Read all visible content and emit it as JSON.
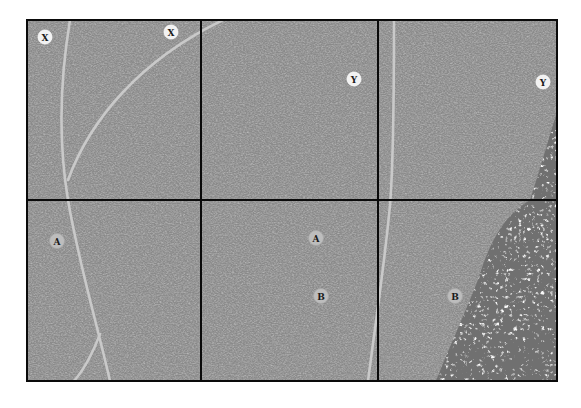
{
  "figure": {
    "type": "six-panel texture diagram",
    "grid": {
      "rows": 2,
      "cols": 3
    },
    "colors": {
      "background": "#ffffff",
      "texture_base": "#8a8a8a",
      "texture_dark": "#5e5e5e",
      "texture_light": "#b4b4b4",
      "frame": "#0a0a0a",
      "trace_line": "#c9c9c9",
      "coarse_region_light": "#eeeeee",
      "marker_top_fill": "#f2f2f2",
      "marker_bottom_fill": "#bdbdbd",
      "marker_text": "#1a1a1a"
    }
  },
  "panels": [
    {
      "id": "top-left",
      "row": 1,
      "col": 1
    },
    {
      "id": "top-middle",
      "row": 1,
      "col": 2
    },
    {
      "id": "top-right",
      "row": 1,
      "col": 3
    },
    {
      "id": "bottom-left",
      "row": 2,
      "col": 1
    },
    {
      "id": "bottom-middle",
      "row": 2,
      "col": 2
    },
    {
      "id": "bottom-right",
      "row": 2,
      "col": 3
    }
  ],
  "markers": [
    {
      "label": "X",
      "panel": "top-left",
      "cx": 45,
      "cy": 37,
      "style": "bright"
    },
    {
      "label": "X",
      "panel": "top-left",
      "cx": 171,
      "cy": 32,
      "style": "bright"
    },
    {
      "label": "Y",
      "panel": "top-middle",
      "cx": 354,
      "cy": 79,
      "style": "bright"
    },
    {
      "label": "Y",
      "panel": "top-right",
      "cx": 543,
      "cy": 82,
      "style": "bright"
    },
    {
      "label": "A",
      "panel": "bottom-left",
      "cx": 57,
      "cy": 241,
      "style": "dim"
    },
    {
      "label": "A",
      "panel": "bottom-middle",
      "cx": 316,
      "cy": 238,
      "style": "dim"
    },
    {
      "label": "B",
      "panel": "bottom-middle",
      "cx": 321,
      "cy": 296,
      "style": "dim"
    },
    {
      "label": "B",
      "panel": "bottom-right",
      "cx": 455,
      "cy": 296,
      "style": "dim"
    }
  ]
}
